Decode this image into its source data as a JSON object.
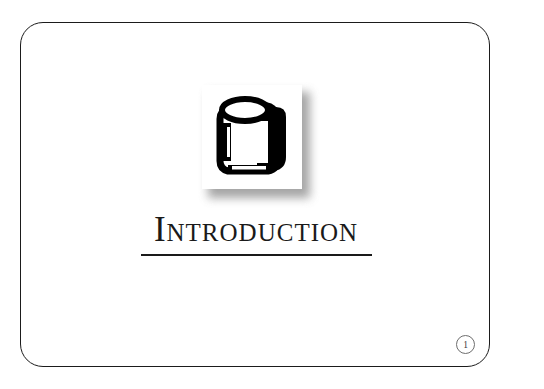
{
  "slide": {
    "title": "Introduction",
    "page_number": "1",
    "background_color": "#ffffff",
    "border_color": "#1b1b1b",
    "text_color": "#1a1a1a",
    "rule_color": "#1a1a1a"
  },
  "icon": {
    "name": "book-binder-icon",
    "tile_background": "#ffffff",
    "glyph_color": "#000000",
    "shadow_color": "#8d8d8d"
  },
  "page_badge": {
    "value": "1",
    "border_color": "#6e6e6e",
    "text_color": "#3a3a3a"
  }
}
